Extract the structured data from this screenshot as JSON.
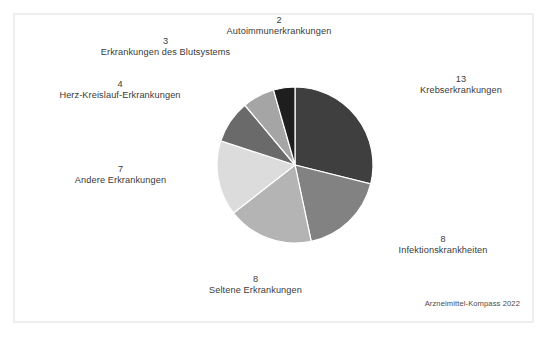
{
  "source_note": "Arzneimittel-Kompass 2022",
  "chart_data": {
    "type": "pie",
    "title": "",
    "subtitle": "",
    "xlabel": "",
    "ylabel": "",
    "total": 45,
    "units": "Anzahl",
    "start_angle_deg": 0,
    "direction": "clockwise",
    "legend_position": "none",
    "labels_outside": true,
    "grid": false,
    "categories": [
      "Krebserkrankungen",
      "Infektionskrankheiten",
      "Seltene Erkrankungen",
      "Andere Erkrankungen",
      "Herz-Kreislauf-Erkrankungen",
      "Erkrankungen des Blutsystems",
      "Autoimmunerkrankungen"
    ],
    "values": [
      13,
      8,
      8,
      7,
      4,
      3,
      2
    ],
    "colors": [
      "#3f3f3f",
      "#828282",
      "#b4b4b4",
      "#dcdcdc",
      "#6a6a6a",
      "#a5a5a5",
      "#1e1e1e"
    ],
    "slices": [
      {
        "label": "Krebserkrankungen",
        "value": 13,
        "color": "#3f3f3f"
      },
      {
        "label": "Infektionskrankheiten",
        "value": 8,
        "color": "#828282"
      },
      {
        "label": "Seltene Erkrankungen",
        "value": 8,
        "color": "#b4b4b4"
      },
      {
        "label": "Andere Erkrankungen",
        "value": 7,
        "color": "#dcdcdc"
      },
      {
        "label": "Herz-Kreislauf-Erkrankungen",
        "value": 4,
        "color": "#6a6a6a"
      },
      {
        "label": "Erkrankungen des Blutsystems",
        "value": 3,
        "color": "#a5a5a5"
      },
      {
        "label": "Autoimmunerkrankungen",
        "value": 2,
        "color": "#1e1e1e"
      }
    ]
  },
  "labels": {
    "krebs": {
      "value": "13",
      "name": "Krebserkrankungen"
    },
    "infektion": {
      "value": "8",
      "name": "Infektionskrankheiten"
    },
    "seltene": {
      "value": "8",
      "name": "Seltene Erkrankungen"
    },
    "andere": {
      "value": "7",
      "name": "Andere Erkrankungen"
    },
    "herz": {
      "value": "4",
      "name": "Herz-Kreislauf-Erkrankungen"
    },
    "blut": {
      "value": "3",
      "name": "Erkrankungen des Blutsystems"
    },
    "autoimmun": {
      "value": "2",
      "name": "Autoimmunerkrankungen"
    }
  },
  "style": {
    "slice_border": "#ffffff",
    "frame_border": "#eeeeee",
    "background": "#ffffff",
    "text_color": "#3a3a3a"
  }
}
